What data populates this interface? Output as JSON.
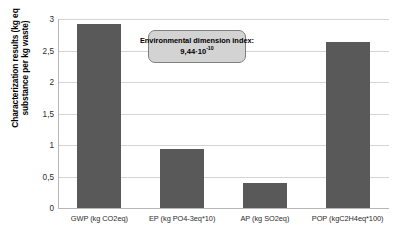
{
  "chart_data": {
    "type": "bar",
    "title": "",
    "xlabel": "",
    "ylabel": "Characterization results (kg eq substance per kg waste)",
    "ylabel_line1": "Characterization results (kg eq",
    "ylabel_line2": "substance per kg waste)",
    "categories": [
      "GWP (kg CO2eq)",
      "EP (kg PO4-3eq*10)",
      "AP (kg SO2eq)",
      "POP (kgC2H4eq*100)"
    ],
    "values": [
      2.92,
      0.93,
      0.4,
      2.63
    ],
    "ylim": [
      0,
      3
    ],
    "ytick_labels": [
      "0",
      "0,5",
      "1",
      "1,5",
      "2",
      "2,5",
      "3"
    ],
    "ytick_values": [
      0,
      0.5,
      1,
      1.5,
      2,
      2.5,
      3
    ],
    "grid": true,
    "legend": "none",
    "bar_color": "#595959",
    "gridline_color": "#d4d4d4",
    "axis_color": "#b6b6b6",
    "annotations": [
      {
        "name": "environmental-dimension-index",
        "line1": "Environmental dimension index:",
        "line2_mantissa": "9,44·10",
        "line2_exponent": "-10",
        "value": "9.44e-10",
        "background": "#d3d3d3",
        "border": "#7f7f7f"
      }
    ]
  }
}
